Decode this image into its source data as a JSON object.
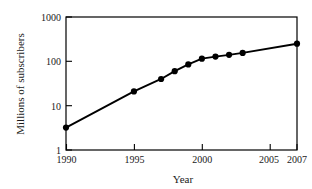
{
  "chart_data": {
    "type": "line",
    "title": "",
    "xlabel": "Year",
    "ylabel": "Millions of subscribers",
    "x": [
      1990,
      1995,
      1997,
      1998,
      1999,
      2000,
      2001,
      2002,
      2003,
      2007
    ],
    "values": [
      3.2,
      21,
      40,
      60,
      85,
      115,
      128,
      140,
      155,
      250
    ],
    "series": [
      {
        "name": "Millions of subscribers",
        "values": [
          3.2,
          21,
          40,
          60,
          85,
          115,
          128,
          140,
          155,
          250
        ]
      }
    ],
    "xlim": [
      1990,
      2007
    ],
    "ylim": [
      1,
      1000
    ],
    "yscale": "log",
    "xscale": "linear",
    "grid": false,
    "legend": false,
    "legend_position": "none",
    "marker": "filled-circle",
    "line_color": "#000000",
    "marker_color": "#000000",
    "xticks": [
      1990,
      1995,
      2000,
      2005,
      2007
    ],
    "xtick_labels": [
      "1990",
      "1995",
      "2000",
      "2005",
      "2007"
    ],
    "yticks": [
      1,
      10,
      100,
      1000
    ],
    "ytick_labels": [
      "1",
      "10",
      "100",
      "1000"
    ]
  },
  "axes": {
    "x_title": "Year",
    "y_title": "Millions of subscribers",
    "x_tick_labels": [
      "1990",
      "1995",
      "2000",
      "2005",
      "2007"
    ],
    "y_tick_labels": [
      "1000",
      "100",
      "10",
      "1"
    ]
  },
  "colors": {
    "background": "#ffffff",
    "frame": "#000000",
    "data": "#000000",
    "text": "#1a1a1a"
  }
}
